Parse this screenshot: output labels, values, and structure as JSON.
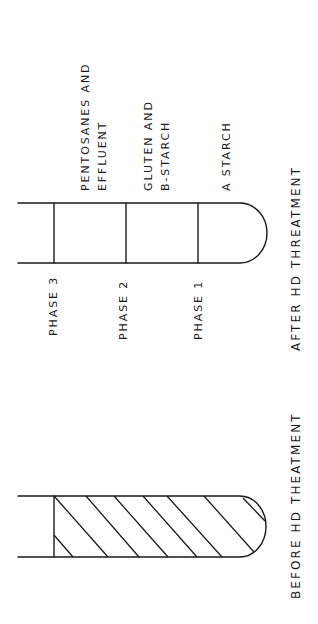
{
  "diagram": {
    "type": "centrifuge-tube-separation",
    "after": {
      "caption": "AFTER   HD  THREATMENT",
      "phases": [
        {
          "label": "PHASE 3",
          "content_line1": "PENTOSANES  AND",
          "content_line2": "EFFLUENT"
        },
        {
          "label": "PHASE  2",
          "content_line1": "GLUTEN  AND",
          "content_line2": "B-STARCH"
        },
        {
          "label": "PHASE  1",
          "content_line1": "A  STARCH",
          "content_line2": ""
        }
      ]
    },
    "before": {
      "caption": "BEFORE   HD  THEATMENT",
      "fill": "hatched"
    },
    "colors": {
      "line": "#1a1a1a",
      "background": "#ffffff"
    }
  }
}
